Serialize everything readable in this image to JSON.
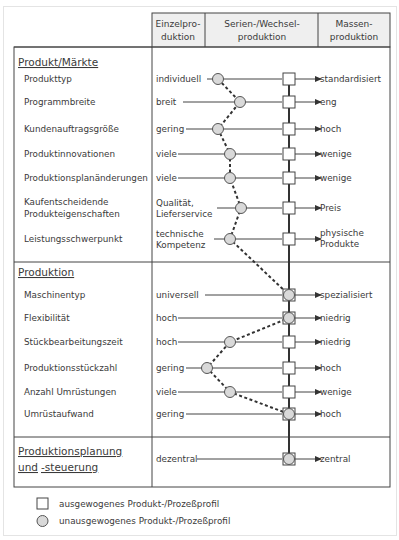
{
  "header": {
    "columns": [
      {
        "line1": "Einzelpro-",
        "line2": "duktion"
      },
      {
        "line1": "Serien-/Wechsel-",
        "line2": "produktion"
      },
      {
        "line1": "Massen-",
        "line2": "produktion"
      }
    ]
  },
  "sections": [
    {
      "title": "Produkt/Märkte",
      "rows": [
        {
          "label": "Produkttyp",
          "left": "individuell",
          "right": "standardisiert"
        },
        {
          "label": "Programmbreite",
          "left": "breit",
          "right": "eng"
        },
        {
          "label": "Kundenauftragsgröße",
          "left": "gering",
          "right": "hoch"
        },
        {
          "label": "Produktinnovationen",
          "left": "viele",
          "right": "wenige"
        },
        {
          "label": "Produktionsplanänderungen",
          "left": "viele",
          "right": "wenige"
        },
        {
          "label_line1": "Kaufentscheidende",
          "label_line2": "Produkteigenschaften",
          "left_line1": "Qualität,",
          "left_line2": "Lieferservice",
          "right": "Preis"
        },
        {
          "label": "Leistungsschwerpunkt",
          "left_line1": "technische",
          "left_line2": "Kompetenz",
          "right_line1": "physische",
          "right_line2": "Produkte"
        }
      ]
    },
    {
      "title": "Produktion",
      "rows": [
        {
          "label": "Maschinentyp",
          "left": "universell",
          "right": "spezialisiert"
        },
        {
          "label": "Flexibilität",
          "left": "hoch",
          "right": "niedrig"
        },
        {
          "label": "Stückbearbeitungszeit",
          "left": "hoch",
          "right": "niedrig"
        },
        {
          "label": "Produktionsstückzahl",
          "left": "gering",
          "right": "hoch"
        },
        {
          "label": "Anzahl Umrüstungen",
          "left": "viele",
          "right": "wenige"
        },
        {
          "label": "Umrüstaufwand",
          "left": "gering",
          "right": "hoch"
        }
      ]
    },
    {
      "title_line1": "Produktionsplanung",
      "title_line2_a": "und",
      "title_line2_b": "-steuerung",
      "rows": [
        {
          "left": "dezentral",
          "right": "zentral"
        }
      ]
    }
  ],
  "legend": [
    {
      "symbol": "square",
      "label": "ausgewogenes Produkt-/Prozeßprofil"
    },
    {
      "symbol": "circle",
      "label": "unausgewogenes Produkt-/Prozeßprofil"
    }
  ],
  "colors": {
    "line": "#333333",
    "circle_fill": "#d9d9d9",
    "header_bg": "#efefef"
  }
}
